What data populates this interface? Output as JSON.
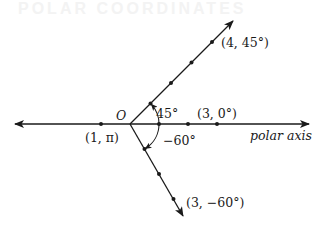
{
  "background_heading": "POLAR COORDINATES",
  "origin_label": "O",
  "axis_label": "polar axis",
  "points": [
    {
      "label": "(4, 45°)",
      "r": 4,
      "theta_deg": 45
    },
    {
      "label": "(3, 0°)",
      "r": 3,
      "theta_deg": 0
    },
    {
      "label": "(1, π)",
      "r": 1,
      "theta_deg": 180
    },
    {
      "label": "(3, −60°)",
      "r": 3,
      "theta_deg": -60
    }
  ],
  "angles": [
    {
      "label": "45°",
      "deg": 45
    },
    {
      "label": "−60°",
      "deg": -60
    }
  ],
  "colors": {
    "ink": "#1a1a1a",
    "background": "#ffffff"
  }
}
